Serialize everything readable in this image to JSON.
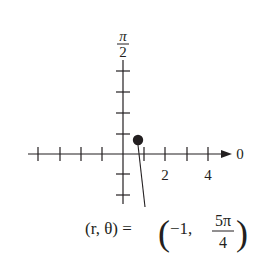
{
  "diagram": {
    "type": "polar-coordinate-plot",
    "axis_labels": {
      "polar_axis": "0",
      "vertical_axis_numerator": "π",
      "vertical_axis_denominator": "2"
    },
    "tick_labels": [
      "2",
      "4"
    ],
    "point": {
      "r": -1,
      "theta": "5π/4"
    },
    "annotation": {
      "lhs": "(r, θ) =",
      "open_paren": "(",
      "r_value": "−1,",
      "theta_numerator": "5π",
      "theta_denominator": "4",
      "close_paren": ")"
    },
    "colors": {
      "ink": "#231f20",
      "background": "#ffffff"
    }
  }
}
